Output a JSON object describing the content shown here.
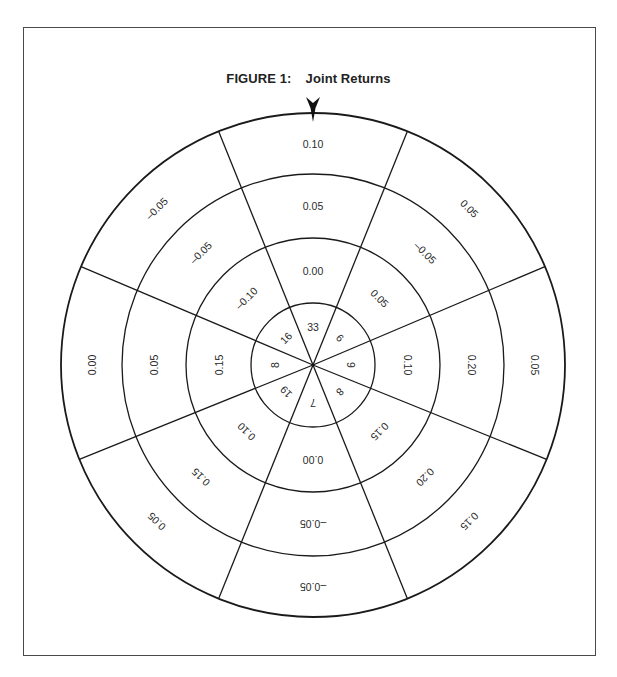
{
  "figure": {
    "title_prefix": "FIGURE 1:",
    "title_text": "Joint Returns",
    "pointer_icon": "arrow-down-marker"
  },
  "chart_data": {
    "type": "polar-sector-table",
    "sectors_count": 8,
    "sector_center_angles_deg": [
      0,
      45,
      90,
      135,
      180,
      225,
      270,
      315
    ],
    "rings": [
      "count",
      "ring_2",
      "ring_3",
      "outer_ring"
    ],
    "sectors": [
      {
        "angle": 0,
        "count": "33",
        "ring_2": "0.00",
        "ring_3": "0.05",
        "outer": "0.10"
      },
      {
        "angle": 45,
        "count": "6",
        "ring_2": "0.05",
        "ring_3": "–0.05",
        "outer": "0.05"
      },
      {
        "angle": 90,
        "count": "9",
        "ring_2": "0.10",
        "ring_3": "0.20",
        "outer": "0.05"
      },
      {
        "angle": 135,
        "count": "8",
        "ring_2": "0.15",
        "ring_3": "0.20",
        "outer": "0.15"
      },
      {
        "angle": 180,
        "count": "7",
        "ring_2": "0.00",
        "ring_3": "–0.05",
        "outer": "–0.05"
      },
      {
        "angle": 225,
        "count": "19",
        "ring_2": "0.10",
        "ring_3": "0.15",
        "outer": "0.05"
      },
      {
        "angle": 270,
        "count": "8",
        "ring_2": "0.15",
        "ring_3": "0.05",
        "outer": "0.00"
      },
      {
        "angle": 315,
        "count": "16",
        "ring_2": "–0.10",
        "ring_3": "–0.05",
        "outer": "–0.05"
      }
    ],
    "geometry": {
      "center": [
        313,
        365
      ],
      "radii": [
        62,
        127,
        191,
        252
      ],
      "boundary_angles_deg": [
        -22,
        22,
        67,
        112,
        158,
        202,
        248,
        293
      ]
    },
    "line_color": "#1a1a1a",
    "background": "#ffffff"
  }
}
